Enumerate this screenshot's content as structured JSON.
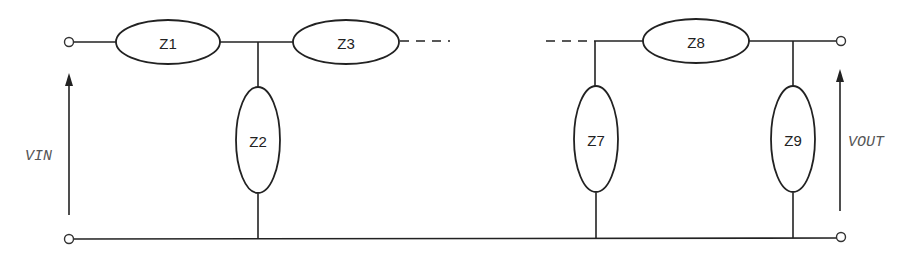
{
  "diagram": {
    "type": "ladder-network",
    "impedances": {
      "z1": "Z1",
      "z2": "Z2",
      "z3": "Z3",
      "z7": "Z7",
      "z8": "Z8",
      "z9": "Z9"
    },
    "voltages": {
      "input": "VIN",
      "output": "VOUT"
    },
    "colors": {
      "line": "#222222",
      "label": "#555555",
      "background": "#ffffff"
    }
  }
}
